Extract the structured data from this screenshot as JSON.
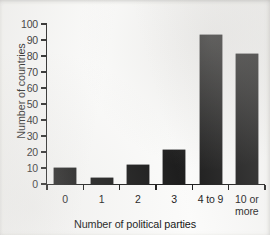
{
  "chart_data": {
    "type": "bar",
    "title": "",
    "categories": [
      "0",
      "1",
      "2",
      "3",
      "4 to 9",
      "10 or more"
    ],
    "values": [
      10,
      4,
      12,
      21,
      93,
      81
    ],
    "xlabel": "Number of political parties",
    "ylabel": "Number of countries",
    "ylim": [
      0,
      100
    ],
    "ytick_step": 10,
    "yticks": [
      0,
      10,
      20,
      30,
      40,
      50,
      60,
      70,
      80,
      90,
      100
    ],
    "ytick_labels": [
      "0",
      "10",
      "20",
      "30",
      "40",
      "50",
      "60",
      "70",
      "80",
      "90",
      "100"
    ],
    "grid": false,
    "legend": false,
    "bar_color": "#1c1c1c",
    "axis_color": "#1d1d1d",
    "background_color": "#fbfbfa"
  },
  "axis": {
    "y_label": "Number of countries",
    "x_label": "Number of political parties"
  },
  "categories_display": [
    {
      "line1": "0",
      "line2": ""
    },
    {
      "line1": "1",
      "line2": ""
    },
    {
      "line1": "2",
      "line2": ""
    },
    {
      "line1": "3",
      "line2": ""
    },
    {
      "line1": "4 to 9",
      "line2": ""
    },
    {
      "line1": "10 or",
      "line2": "more"
    }
  ]
}
